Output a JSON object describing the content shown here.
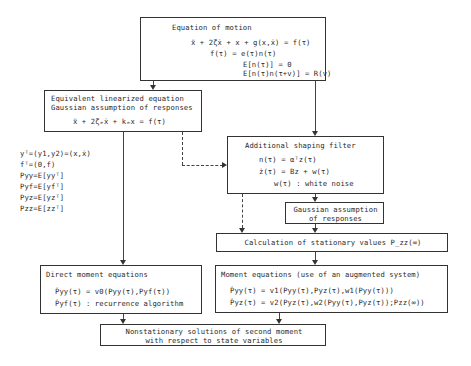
{
  "boxes": {
    "equation_of_motion": {
      "title": "Equation of motion",
      "lines": [
        "ẍ + 2ζẋ + x + g(x,ẋ) = f(τ)",
        "f(τ) = e(τ)n(τ)",
        "E[n(τ)] = 0",
        "E[n(τ)n(τ+v)] = R(v)"
      ]
    },
    "linearized": {
      "title_line1": "Equivalent linearized equation",
      "title_line2": "Gaussian assumption of responses",
      "equation": "ẍ + 2ζₑẋ + kₑx = f(τ)"
    },
    "shaping_filter": {
      "title": "Additional shaping filter",
      "lines": [
        "n(τ) = αᵀz(τ)",
        "ż(τ) = Bz +  w(τ)",
        "w(τ) : white noise"
      ]
    },
    "gaussian": {
      "line1": "Gaussian assumption",
      "line2": "of responses"
    },
    "stationary": {
      "label": "Calculation of stationary values P_zz(∞)"
    },
    "direct_moment": {
      "title": "Direct moment equations",
      "lines": [
        "Ṗyy(τ) = v0(Pyy(τ),Pyf(τ))",
        "Ṗyf(τ) : recurrence algorithm"
      ]
    },
    "moment_augmented": {
      "title": "Moment equations (use of an augmented system)",
      "lines": [
        "Ṗyy(τ) = v1(Pyy(τ),Pyz(τ),w1(Pyy(τ)))",
        "Ṗyz(τ) = v2(Pyz(τ),w2(Pyy(τ),Pyz(τ));Pzz(∞))"
      ]
    },
    "nonstationary": {
      "line1": "Nonstationary solutions of second moment",
      "line2": "with respect to state variables"
    }
  },
  "definitions": [
    "yᵀ=(y1,y2)=(x,ẋ)",
    "fᵀ=(0,f)",
    "Pyy=E[yyᵀ]",
    "Pyf=E[yfᵀ]",
    "Pyz=E[yzᵀ]",
    "Pzz=E[zzᵀ]"
  ]
}
